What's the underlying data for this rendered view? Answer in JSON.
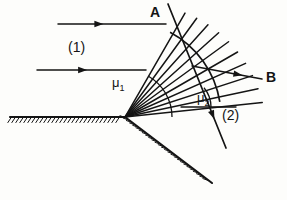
{
  "figure": {
    "background_color": "#fdfdfb",
    "line_color": "#141414",
    "labels": {
      "point_a": "A",
      "point_b": "B",
      "medium_one": "(1)",
      "medium_two": "(2)",
      "angle_one_base": "μ",
      "angle_one_sub": "1",
      "angle_two_base": "μ",
      "angle_two_sub": "2"
    },
    "icons": {
      "incident_arrow": "arrow-right-icon",
      "refracted_arrow": "arrow-down-right-icon",
      "transmitted_arrow": "arrow-down-right-icon"
    }
  },
  "chart_data": {
    "type": "diagram",
    "vertex": {
      "x": 125,
      "y": 117
    },
    "interface": {
      "horizontal_surface": {
        "x1": 10,
        "y1": 117,
        "x2": 125,
        "y2": 117
      },
      "oblique_surface": {
        "x1": 125,
        "y1": 117,
        "x2": 212,
        "y2": 183
      },
      "hatching_side": "below",
      "hatch_spacing": 4,
      "hatch_length": 7
    },
    "incident_rays": [
      {
        "x1": 58,
        "y1": 24,
        "x2": 166,
        "y2": 24,
        "arrow_at": 0.42
      },
      {
        "x1": 37,
        "y1": 70,
        "x2": 146,
        "y2": 70,
        "arrow_at": 0.46
      }
    ],
    "fan_rays": {
      "origin": {
        "x": 125,
        "y": 117
      },
      "count": 10,
      "angles_deg": [
        60,
        54,
        48,
        42,
        36,
        30,
        24,
        18,
        12,
        6
      ],
      "lengths": [
        120,
        122,
        124,
        126,
        128,
        130,
        132,
        134,
        136,
        138
      ]
    },
    "wavefront_arc": {
      "center": {
        "x": 125,
        "y": 117
      },
      "radius": 96,
      "start_angle_deg": 62,
      "end_angle_deg": 9
    },
    "wavefront_line_AB": {
      "x1": 168,
      "y1": 4,
      "x2": 226,
      "y2": 148,
      "arrow_at": 0.8
    },
    "transmitted_ray_B": {
      "x1": 192,
      "y1": 66,
      "x2": 262,
      "y2": 79,
      "arrow_at": 0.72
    },
    "angle_markers": [
      {
        "name": "mu_1",
        "vertex": {
          "x": 125,
          "y": 117
        },
        "radius": 47,
        "from_deg": 0,
        "to_deg": 60
      },
      {
        "name": "mu_2",
        "vertex": {
          "x": 181,
          "y": 107
        },
        "radius": 30,
        "from_deg": 0,
        "to_deg": 40
      }
    ],
    "mu2_baseline": {
      "x1": 181,
      "y1": 107,
      "x2": 236,
      "y2": 107
    }
  }
}
